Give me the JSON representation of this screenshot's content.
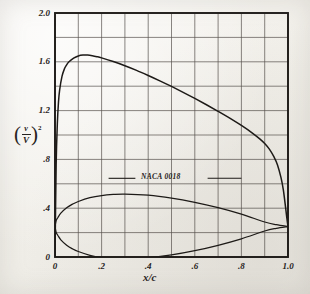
{
  "figure": {
    "kind": "velocity-distribution-plot",
    "background_color": "#f4f2ee",
    "ink_color": "#262220"
  },
  "yaxis": {
    "title_paren_open": "(",
    "title_numerator": "v",
    "title_denominator": "V",
    "title_paren_close": ")",
    "title_exponent": "2",
    "ticks": [
      "2.0",
      "1.6",
      "1.2",
      ".8",
      ".4",
      "0"
    ],
    "tick_values": [
      2.0,
      1.6,
      1.2,
      0.8,
      0.4,
      0.0
    ],
    "min": 0,
    "max": 2.0,
    "minor_step": 0.2
  },
  "xaxis": {
    "title": "x/c",
    "ticks": [
      "0",
      ".2",
      ".4",
      ".6",
      ".8",
      "1.0"
    ],
    "tick_values": [
      0,
      0.2,
      0.4,
      0.6,
      0.8,
      1.0
    ],
    "min": 0,
    "max": 1.0,
    "minor_step": 0.1
  },
  "annotation": {
    "airfoil_name": "NACA 0018",
    "leader_y": 0.645,
    "leader_left_from": 0.23,
    "leader_left_to": 0.345,
    "leader_right_from": 0.655,
    "leader_right_to": 0.8
  },
  "chart_data": {
    "type": "line",
    "title": "",
    "subtitle": "",
    "xlabel": "x/c",
    "ylabel": "(v/V)^2",
    "xlim": [
      0,
      1.0
    ],
    "ylim": [
      0,
      2.0
    ],
    "grid": true,
    "grid_x_step": 0.1,
    "grid_y_step": 0.2,
    "legend": "none",
    "annotations": [
      "NACA 0018"
    ],
    "series": [
      {
        "name": "(v/V)^2 velocity distribution",
        "x": [
          0.0,
          0.005,
          0.01,
          0.015,
          0.02,
          0.03,
          0.04,
          0.05,
          0.06,
          0.08,
          0.1,
          0.12,
          0.14,
          0.16,
          0.18,
          0.2,
          0.25,
          0.3,
          0.35,
          0.4,
          0.45,
          0.5,
          0.55,
          0.6,
          0.65,
          0.7,
          0.75,
          0.8,
          0.85,
          0.88,
          0.9,
          0.92,
          0.94,
          0.955,
          0.97,
          0.98,
          0.99,
          0.995,
          1.0
        ],
        "y": [
          0.0,
          0.76,
          1.09,
          1.27,
          1.37,
          1.48,
          1.54,
          1.575,
          1.6,
          1.63,
          1.648,
          1.655,
          1.655,
          1.65,
          1.642,
          1.632,
          1.602,
          1.568,
          1.53,
          1.488,
          1.444,
          1.398,
          1.35,
          1.3,
          1.248,
          1.194,
          1.138,
          1.078,
          1.012,
          0.966,
          0.93,
          0.884,
          0.82,
          0.755,
          0.65,
          0.55,
          0.4,
          0.32,
          0.25
        ]
      },
      {
        "name": "NACA 0018 airfoil upper surface",
        "x": [
          0.0,
          0.005,
          0.0125,
          0.025,
          0.05,
          0.075,
          0.1,
          0.15,
          0.2,
          0.25,
          0.3,
          0.4,
          0.5,
          0.6,
          0.7,
          0.8,
          0.9,
          0.95,
          1.0
        ],
        "y": [
          0.25,
          0.298,
          0.324,
          0.359,
          0.403,
          0.433,
          0.455,
          0.486,
          0.504,
          0.513,
          0.516,
          0.507,
          0.483,
          0.448,
          0.404,
          0.351,
          0.287,
          0.265,
          0.25
        ]
      },
      {
        "name": "NACA 0018 airfoil lower surface",
        "x": [
          0.0,
          0.005,
          0.0125,
          0.025,
          0.05,
          0.075,
          0.1,
          0.15,
          0.2,
          0.25,
          0.3,
          0.4,
          0.5,
          0.6,
          0.7,
          0.8,
          0.9,
          0.95,
          1.0
        ],
        "y": [
          0.25,
          0.202,
          0.176,
          0.141,
          0.097,
          0.067,
          0.045,
          0.014,
          -0.004,
          -0.013,
          -0.016,
          -0.007,
          0.017,
          0.052,
          0.096,
          0.149,
          0.213,
          0.235,
          0.25
        ]
      }
    ]
  }
}
